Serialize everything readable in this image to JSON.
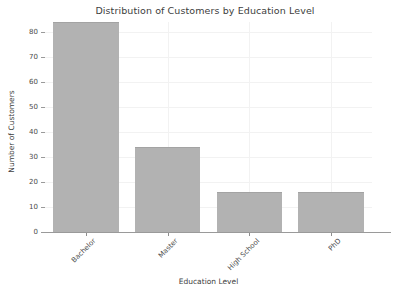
{
  "chart_data": {
    "type": "bar",
    "title": "Distribution of Customers by Education Level",
    "xlabel": "Education Level",
    "ylabel": "Number of Customers",
    "categories": [
      "Bachelor",
      "Master",
      "High School",
      "PhD"
    ],
    "values": [
      84,
      34,
      16,
      16
    ],
    "ylim": [
      0,
      84
    ],
    "yticks": [
      0,
      10,
      20,
      30,
      40,
      50,
      60,
      70,
      80
    ],
    "ytick_labels": [
      "0",
      "10",
      "20",
      "30",
      "40",
      "50",
      "60",
      "70",
      "80"
    ],
    "grid": true,
    "legend": null,
    "bar_color": "#b2b2b2",
    "bar_edge_color": "#a3a3a3",
    "grid_color": "#f2f2f2",
    "axis_color": "#9a9a9a",
    "text_color": "#404040",
    "background": "#ffffff",
    "xtick_rotation": -45
  }
}
